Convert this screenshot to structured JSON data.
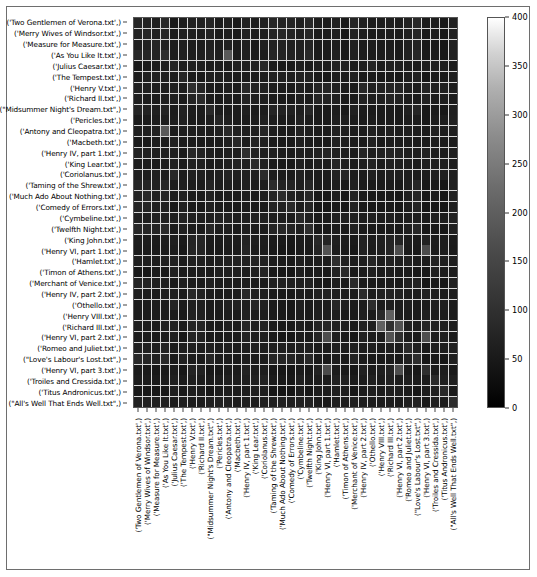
{
  "figure": {
    "type": "heatmap-figure",
    "background": "#ffffff",
    "border_color": "#6e6e6e"
  },
  "chart_data": {
    "type": "heatmap",
    "title": "",
    "xlabel": "",
    "ylabel": "",
    "grid": true,
    "gridline_color": "#d8d8d8",
    "colormap": "gray",
    "colorbar": {
      "position": "right",
      "vmin": 0,
      "vmax": 400,
      "ticks": [
        0,
        50,
        100,
        150,
        200,
        250,
        300,
        350,
        400
      ],
      "tick_labels": [
        "0",
        "50",
        "100",
        "150",
        "200",
        "250",
        "300",
        "350",
        "400"
      ],
      "low_color": "#000000",
      "high_color": "#ffffff"
    },
    "categories": [
      "('Two Gentlemen of Verona.txt',)",
      "('Merry Wives of Windsor.txt',)",
      "('Measure for Measure.txt',)",
      "('As You Like It.txt',)",
      "('Julius Caesar.txt',)",
      "('The Tempest.txt',)",
      "('Henry V.txt',)",
      "('Richard II.txt',)",
      "(\"Midsummer Night's Dream.txt\",)",
      "('Pericles.txt',)",
      "('Antony and Cleopatra.txt',)",
      "('Macbeth.txt',)",
      "('Henry IV, part 1.txt',)",
      "('King Lear.txt',)",
      "('Coriolanus.txt',)",
      "('Taming of the Shrew.txt',)",
      "('Much Ado About Nothing.txt',)",
      "('Comedy of Errors.txt',)",
      "('Cymbeline.txt',)",
      "('Twelfth Night.txt',)",
      "('King John.txt',)",
      "('Henry VI, part 1.txt',)",
      "('Hamlet.txt',)",
      "('Timon of Athens.txt',)",
      "('Merchant of Venice.txt',)",
      "('Henry IV, part 2.txt',)",
      "('Othello.txt',)",
      "('Henry VIII.txt',)",
      "('Richard III.txt',)",
      "('Henry VI, part 2.txt',)",
      "('Romeo and Juliet.txt',)",
      "(\"Love's Labour's Lost.txt\",)",
      "('Henry VI, part 3.txt',)",
      "('Troiles and Cressida.txt',)",
      "('Titus Andronicus.txt',)",
      "(\"All's Well That Ends Well.txt\",)"
    ],
    "x_categories": [
      "('Two Gentlemen of Verona.txt',)",
      "('Merry Wives of Windsor.txt',)",
      "('Measure for Measure.txt',)",
      "('As You Like It.txt',)",
      "('Julius Caesar.txt',)",
      "('The Tempest.txt',)",
      "('Henry V.txt',)",
      "('Richard II.txt',)",
      "(\"Midsummer Night's Dream.txt\",)",
      "('Pericles.txt',)",
      "('Antony and Cleopatra.txt',)",
      "('Macbeth.txt',)",
      "('Henry IV, part 1.txt',)",
      "('King Lear.txt',)",
      "('Coriolanus.txt',)",
      "('Taming of the Shrew.txt',)",
      "('Much Ado About Nothing.txt',)",
      "('Comedy of Errors.txt',)",
      "('Cymbeline.txt',)",
      "('Twelfth Night.txt',)",
      "('King John.txt',)",
      "('Henry VI, part 1.txt',)",
      "('Hamlet.txt',)",
      "('Timon of Athens.txt',)",
      "('Merchant of Venice.txt',)",
      "('Henry IV, part 2.txt',)",
      "('Othello.txt',)",
      "('Henry VIII.txt',)",
      "('Richard III.txt',)",
      "('Henry VI, part 2.txt',)",
      "('Romeo and Juliet.txt',)",
      "(\"Love's Labour's Lost.txt\",)",
      "('Henry VI, part 3.txt',)",
      "('Troiles and Cressida.txt',)",
      "('Titus Andronicus.txt',)",
      "(\"All's Well That Ends Well.txt\",)"
    ],
    "matrix": [
      [
        60,
        55,
        48,
        62,
        40,
        45,
        52,
        50,
        58,
        44,
        50,
        42,
        54,
        46,
        48,
        60,
        56,
        58,
        50,
        62,
        46,
        44,
        50,
        40,
        56,
        48,
        44,
        46,
        48,
        44,
        52,
        64,
        42,
        46,
        40,
        54
      ],
      [
        55,
        58,
        52,
        60,
        42,
        48,
        50,
        46,
        54,
        42,
        48,
        40,
        52,
        44,
        46,
        58,
        62,
        56,
        48,
        60,
        44,
        42,
        48,
        38,
        54,
        46,
        42,
        44,
        46,
        42,
        50,
        60,
        40,
        44,
        38,
        52
      ],
      [
        48,
        52,
        56,
        54,
        44,
        50,
        46,
        44,
        50,
        46,
        52,
        44,
        48,
        42,
        50,
        52,
        54,
        50,
        52,
        56,
        42,
        40,
        46,
        42,
        50,
        44,
        46,
        42,
        44,
        40,
        48,
        54,
        38,
        42,
        36,
        50
      ],
      [
        62,
        60,
        54,
        70,
        46,
        52,
        48,
        50,
        56,
        48,
        140,
        46,
        50,
        44,
        46,
        60,
        58,
        54,
        50,
        64,
        44,
        42,
        50,
        40,
        52,
        46,
        44,
        46,
        48,
        42,
        54,
        62,
        40,
        44,
        38,
        52
      ],
      [
        40,
        42,
        44,
        46,
        58,
        44,
        50,
        48,
        44,
        46,
        44,
        50,
        48,
        52,
        62,
        44,
        42,
        40,
        48,
        44,
        48,
        46,
        54,
        52,
        42,
        48,
        58,
        44,
        50,
        48,
        46,
        42,
        46,
        50,
        48,
        44
      ],
      [
        45,
        48,
        50,
        52,
        44,
        60,
        44,
        42,
        52,
        50,
        48,
        46,
        44,
        42,
        46,
        50,
        50,
        48,
        54,
        52,
        40,
        38,
        46,
        44,
        48,
        42,
        44,
        40,
        42,
        38,
        46,
        52,
        36,
        42,
        40,
        48
      ],
      [
        52,
        50,
        46,
        48,
        50,
        44,
        72,
        58,
        46,
        44,
        50,
        46,
        64,
        54,
        52,
        46,
        44,
        42,
        50,
        46,
        56,
        58,
        52,
        46,
        44,
        62,
        50,
        54,
        58,
        56,
        48,
        46,
        56,
        50,
        48,
        46
      ],
      [
        50,
        46,
        44,
        50,
        48,
        42,
        58,
        68,
        44,
        42,
        48,
        44,
        56,
        50,
        48,
        44,
        42,
        40,
        48,
        44,
        58,
        56,
        50,
        44,
        42,
        54,
        48,
        50,
        56,
        54,
        46,
        44,
        54,
        46,
        46,
        44
      ],
      [
        58,
        54,
        50,
        56,
        44,
        52,
        46,
        44,
        64,
        46,
        46,
        44,
        48,
        42,
        44,
        56,
        54,
        52,
        48,
        60,
        42,
        40,
        46,
        40,
        50,
        44,
        42,
        42,
        44,
        40,
        50,
        58,
        38,
        42,
        36,
        50
      ],
      [
        44,
        42,
        46,
        48,
        46,
        50,
        44,
        42,
        46,
        58,
        50,
        44,
        44,
        46,
        48,
        46,
        44,
        44,
        54,
        46,
        42,
        40,
        48,
        48,
        44,
        42,
        46,
        42,
        44,
        40,
        46,
        44,
        38,
        46,
        44,
        52
      ],
      [
        50,
        48,
        52,
        140,
        44,
        48,
        50,
        48,
        46,
        50,
        66,
        50,
        48,
        50,
        56,
        48,
        46,
        44,
        54,
        48,
        46,
        44,
        52,
        50,
        46,
        46,
        52,
        46,
        50,
        46,
        48,
        46,
        44,
        50,
        46,
        50
      ],
      [
        42,
        40,
        44,
        46,
        50,
        46,
        46,
        44,
        44,
        44,
        50,
        62,
        46,
        54,
        50,
        44,
        42,
        40,
        48,
        44,
        44,
        42,
        54,
        48,
        42,
        44,
        54,
        42,
        46,
        44,
        46,
        42,
        42,
        46,
        44,
        46
      ],
      [
        54,
        52,
        48,
        50,
        48,
        44,
        64,
        56,
        48,
        44,
        48,
        46,
        70,
        52,
        50,
        48,
        46,
        44,
        50,
        48,
        54,
        56,
        50,
        46,
        44,
        60,
        48,
        52,
        56,
        54,
        48,
        48,
        54,
        48,
        46,
        48
      ],
      [
        46,
        44,
        42,
        44,
        52,
        42,
        54,
        50,
        42,
        46,
        50,
        54,
        52,
        66,
        54,
        44,
        42,
        40,
        50,
        44,
        48,
        46,
        56,
        50,
        42,
        48,
        56,
        44,
        50,
        48,
        48,
        44,
        46,
        50,
        48,
        46
      ],
      [
        48,
        46,
        50,
        46,
        62,
        46,
        52,
        48,
        44,
        48,
        56,
        50,
        50,
        54,
        68,
        46,
        44,
        42,
        52,
        46,
        46,
        44,
        54,
        56,
        44,
        46,
        52,
        46,
        50,
        48,
        46,
        44,
        46,
        54,
        48,
        48
      ],
      [
        60,
        58,
        52,
        60,
        44,
        50,
        46,
        44,
        56,
        46,
        48,
        44,
        48,
        44,
        46,
        68,
        56,
        56,
        48,
        60,
        42,
        40,
        46,
        40,
        52,
        44,
        42,
        42,
        44,
        40,
        50,
        60,
        38,
        42,
        36,
        50
      ],
      [
        56,
        62,
        54,
        58,
        42,
        50,
        44,
        42,
        54,
        44,
        46,
        42,
        46,
        42,
        44,
        56,
        70,
        54,
        48,
        62,
        40,
        38,
        44,
        38,
        54,
        42,
        40,
        40,
        42,
        38,
        48,
        58,
        36,
        40,
        34,
        54
      ],
      [
        58,
        56,
        50,
        54,
        40,
        48,
        42,
        40,
        52,
        44,
        44,
        40,
        44,
        40,
        42,
        56,
        54,
        66,
        46,
        58,
        38,
        36,
        42,
        36,
        50,
        40,
        38,
        38,
        40,
        36,
        46,
        56,
        34,
        38,
        34,
        48
      ],
      [
        50,
        48,
        52,
        50,
        48,
        54,
        50,
        48,
        48,
        54,
        54,
        48,
        50,
        50,
        52,
        48,
        48,
        46,
        64,
        50,
        44,
        42,
        50,
        48,
        48,
        46,
        50,
        46,
        48,
        44,
        48,
        48,
        42,
        50,
        46,
        52
      ],
      [
        62,
        60,
        56,
        64,
        44,
        52,
        46,
        44,
        60,
        46,
        48,
        44,
        48,
        44,
        46,
        60,
        62,
        58,
        50,
        72,
        42,
        40,
        46,
        40,
        52,
        44,
        42,
        42,
        44,
        40,
        50,
        62,
        38,
        42,
        36,
        52
      ],
      [
        46,
        44,
        42,
        44,
        48,
        40,
        56,
        58,
        42,
        42,
        46,
        44,
        54,
        48,
        46,
        42,
        40,
        38,
        44,
        42,
        62,
        58,
        48,
        44,
        40,
        54,
        46,
        50,
        56,
        56,
        46,
        42,
        54,
        46,
        46,
        42
      ],
      [
        44,
        42,
        40,
        42,
        46,
        38,
        58,
        56,
        40,
        40,
        44,
        42,
        56,
        46,
        44,
        40,
        38,
        36,
        42,
        40,
        58,
        130,
        46,
        42,
        38,
        54,
        44,
        48,
        58,
        120,
        44,
        40,
        118,
        44,
        46,
        40
      ],
      [
        50,
        48,
        46,
        50,
        54,
        46,
        52,
        50,
        46,
        48,
        52,
        54,
        50,
        56,
        54,
        46,
        44,
        42,
        50,
        46,
        48,
        46,
        70,
        52,
        46,
        48,
        60,
        46,
        52,
        48,
        52,
        46,
        46,
        54,
        50,
        48
      ],
      [
        40,
        38,
        42,
        40,
        52,
        44,
        46,
        44,
        40,
        48,
        50,
        48,
        46,
        50,
        56,
        40,
        38,
        36,
        48,
        40,
        44,
        42,
        52,
        66,
        40,
        44,
        50,
        42,
        46,
        42,
        44,
        40,
        40,
        52,
        46,
        46
      ],
      [
        56,
        54,
        50,
        52,
        42,
        48,
        44,
        42,
        50,
        44,
        46,
        42,
        44,
        42,
        44,
        52,
        54,
        50,
        48,
        52,
        40,
        38,
        46,
        40,
        66,
        42,
        42,
        40,
        42,
        38,
        48,
        54,
        36,
        42,
        36,
        50
      ],
      [
        48,
        46,
        44,
        46,
        48,
        42,
        62,
        54,
        44,
        42,
        46,
        44,
        60,
        48,
        46,
        44,
        42,
        40,
        46,
        44,
        54,
        54,
        48,
        44,
        42,
        68,
        46,
        50,
        54,
        52,
        46,
        44,
        52,
        46,
        44,
        46
      ],
      [
        44,
        42,
        46,
        44,
        58,
        44,
        50,
        48,
        42,
        46,
        52,
        54,
        48,
        56,
        52,
        42,
        40,
        38,
        50,
        42,
        46,
        44,
        60,
        50,
        42,
        46,
        70,
        44,
        48,
        46,
        48,
        42,
        44,
        52,
        48,
        46
      ],
      [
        46,
        44,
        42,
        46,
        44,
        40,
        54,
        50,
        42,
        42,
        46,
        42,
        52,
        44,
        46,
        42,
        40,
        38,
        46,
        42,
        50,
        48,
        46,
        42,
        40,
        50,
        44,
        64,
        150,
        46,
        44,
        42,
        48,
        44,
        44,
        44
      ],
      [
        48,
        46,
        44,
        48,
        50,
        42,
        58,
        56,
        44,
        44,
        50,
        46,
        56,
        50,
        50,
        44,
        42,
        40,
        48,
        44,
        56,
        58,
        52,
        46,
        42,
        54,
        48,
        150,
        76,
        130,
        50,
        44,
        56,
        52,
        48,
        46
      ],
      [
        44,
        42,
        40,
        42,
        48,
        38,
        56,
        54,
        40,
        40,
        46,
        44,
        54,
        48,
        48,
        40,
        38,
        36,
        44,
        40,
        56,
        120,
        48,
        42,
        38,
        52,
        46,
        46,
        130,
        74,
        46,
        40,
        122,
        46,
        48,
        42
      ],
      [
        52,
        50,
        48,
        54,
        46,
        46,
        48,
        46,
        50,
        46,
        48,
        46,
        48,
        48,
        46,
        50,
        48,
        46,
        48,
        50,
        46,
        44,
        52,
        44,
        48,
        46,
        48,
        44,
        50,
        46,
        68,
        52,
        42,
        48,
        44,
        50
      ],
      [
        64,
        60,
        54,
        62,
        42,
        52,
        46,
        44,
        58,
        44,
        46,
        42,
        48,
        44,
        44,
        60,
        58,
        56,
        48,
        62,
        42,
        40,
        46,
        40,
        54,
        44,
        42,
        42,
        44,
        40,
        52,
        74,
        38,
        42,
        36,
        52
      ],
      [
        42,
        40,
        38,
        40,
        46,
        36,
        56,
        54,
        38,
        38,
        44,
        42,
        54,
        46,
        46,
        38,
        36,
        34,
        42,
        38,
        54,
        118,
        46,
        40,
        36,
        52,
        44,
        48,
        56,
        122,
        42,
        38,
        72,
        44,
        46,
        40
      ],
      [
        46,
        44,
        42,
        44,
        50,
        42,
        50,
        46,
        42,
        46,
        50,
        46,
        48,
        50,
        54,
        42,
        40,
        38,
        50,
        42,
        46,
        44,
        54,
        52,
        42,
        46,
        52,
        44,
        52,
        46,
        48,
        42,
        44,
        66,
        48,
        48
      ],
      [
        40,
        38,
        36,
        38,
        48,
        40,
        48,
        46,
        36,
        44,
        46,
        44,
        46,
        48,
        48,
        36,
        34,
        34,
        46,
        36,
        46,
        46,
        50,
        46,
        36,
        44,
        48,
        44,
        48,
        48,
        44,
        36,
        46,
        48,
        62,
        42
      ],
      [
        54,
        52,
        50,
        52,
        44,
        48,
        46,
        44,
        50,
        52,
        50,
        46,
        48,
        46,
        48,
        50,
        54,
        48,
        52,
        52,
        42,
        40,
        48,
        46,
        50,
        46,
        46,
        44,
        46,
        42,
        50,
        52,
        40,
        48,
        42,
        70
      ]
    ]
  }
}
